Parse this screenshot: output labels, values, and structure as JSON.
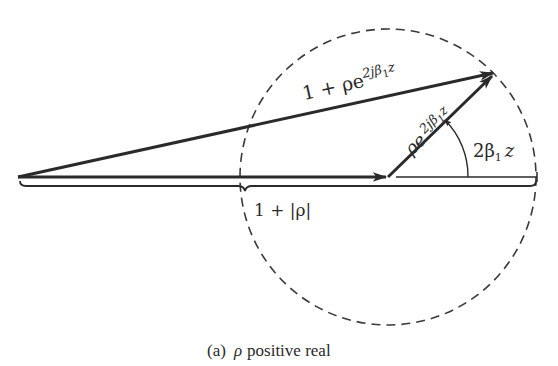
{
  "figure": {
    "caption": {
      "prefix": "(a)",
      "symbol": "ρ",
      "text": "positive real"
    },
    "labels": {
      "sum_vector": {
        "base": "1 + ρe",
        "exponent": "2jβ",
        "exp_sub": "1",
        "exp_tail": "z"
      },
      "reflected_vector": {
        "base": "ρe",
        "exponent": "2jβ",
        "exp_sub": "1",
        "exp_tail": "z"
      },
      "angle": {
        "base": "2β",
        "sub": "1",
        "tail": "z"
      },
      "magnitude": "1 + |ρ|"
    },
    "geometry": {
      "origin": [
        18,
        177
      ],
      "unit_vector_tip": [
        388,
        177
      ],
      "sum_tip": [
        495,
        72
      ],
      "circle_center": [
        388,
        177
      ],
      "circle_radius": 148,
      "brace_end": [
        537,
        186
      ]
    },
    "colors": {
      "ink": "#2a2a2a",
      "background": "#ffffff"
    }
  }
}
